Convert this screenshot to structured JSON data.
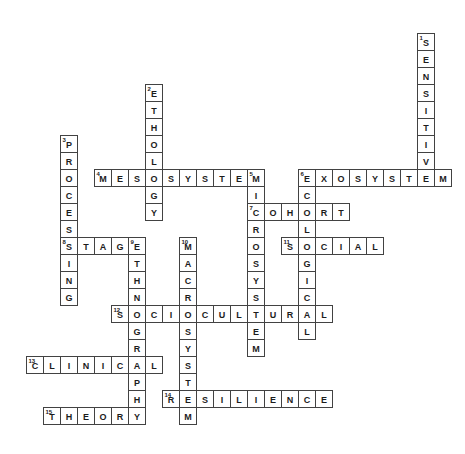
{
  "puzzle": {
    "name": "crossword-answer-grid",
    "grid": {
      "rows": 23,
      "cols": 25,
      "cell_px": 17
    },
    "colors": {
      "background": "#ffffff",
      "cell_fill": "#ffffff",
      "cell_border": "#424242",
      "letter": "#1c1c1c",
      "number": "#1c1c1c"
    },
    "words": [
      {
        "number": 1,
        "answer": "SENSITIVE",
        "direction": "down",
        "row": 0,
        "col": 23
      },
      {
        "number": 2,
        "answer": "ETHOLOGY",
        "direction": "down",
        "row": 3,
        "col": 7
      },
      {
        "number": 3,
        "answer": "PROCESSING",
        "direction": "down",
        "row": 6,
        "col": 2
      },
      {
        "number": 4,
        "answer": "MESOSYSTEM",
        "direction": "across",
        "row": 8,
        "col": 4
      },
      {
        "number": 5,
        "answer": "MICROSYSTEM",
        "direction": "down",
        "row": 8,
        "col": 13
      },
      {
        "number": 6,
        "answer": "EXOSYSTEM",
        "direction": "across",
        "row": 8,
        "col": 16
      },
      {
        "number": 6,
        "answer": "ECOLOGICAL",
        "direction": "down",
        "row": 8,
        "col": 16
      },
      {
        "number": 7,
        "answer": "COHORT",
        "direction": "across",
        "row": 10,
        "col": 13
      },
      {
        "number": 8,
        "answer": "STAGE",
        "direction": "across",
        "row": 12,
        "col": 2
      },
      {
        "number": 9,
        "answer": "ETHNOGRAPHY",
        "direction": "down",
        "row": 12,
        "col": 6
      },
      {
        "number": 10,
        "answer": "MACROSYSTEM",
        "direction": "down",
        "row": 12,
        "col": 9
      },
      {
        "number": 11,
        "answer": "SOCIAL",
        "direction": "across",
        "row": 12,
        "col": 15
      },
      {
        "number": 12,
        "answer": "SOCIOCULTURAL",
        "direction": "across",
        "row": 16,
        "col": 5
      },
      {
        "number": 13,
        "answer": "CLINICAL",
        "direction": "across",
        "row": 19,
        "col": 0
      },
      {
        "number": 14,
        "answer": "RESILIENCE",
        "direction": "across",
        "row": 21,
        "col": 8
      },
      {
        "number": 15,
        "answer": "THEORY",
        "direction": "across",
        "row": 22,
        "col": 1
      }
    ]
  }
}
